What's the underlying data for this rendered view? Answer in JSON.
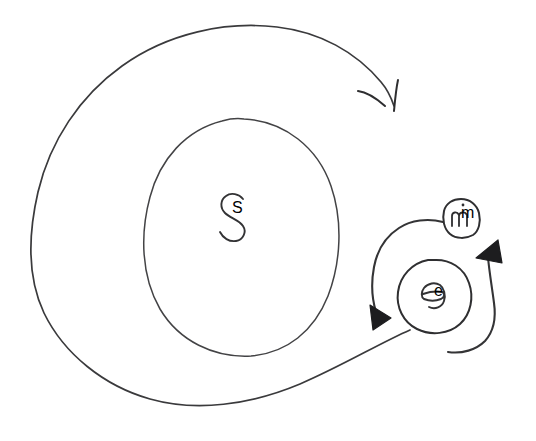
{
  "diagram": {
    "title": "Hand-drawn spiral diagram with labelled regions S, e and m",
    "style": "hand-drawn-pen-sketch",
    "background_color": "#ffffff",
    "ink_color": "#3a3a3c",
    "arrowhead_color": "#1d1d1f",
    "canvas": {
      "width": 536,
      "height": 441
    },
    "labels": [
      {
        "id": "label-s",
        "text": "S",
        "glyph": "s-letter",
        "x": 232,
        "y": 213,
        "container": "inner-oval",
        "description": "Letter S inside the large inner oval"
      },
      {
        "id": "label-e",
        "text": "e",
        "glyph": "e-letter",
        "x": 434,
        "y": 296,
        "container": "e-circle",
        "description": "Letter e inside the small circle at right"
      },
      {
        "id": "label-m",
        "text": "m",
        "glyph": "m-letter",
        "x": 461,
        "y": 218,
        "container": "m-blob",
        "description": "Letter m inside the tiny blob above the e circle"
      }
    ],
    "shapes": [
      {
        "id": "outer-spiral",
        "kind": "spiral-arrow",
        "label": "outer spiral sweep",
        "direction": "clockwise",
        "arrowhead": "open-v",
        "arrowhead_x": 394,
        "arrowhead_y": 110
      },
      {
        "id": "inner-oval",
        "kind": "closed-oval",
        "label": "inner oval S region",
        "center_x": 240,
        "center_y": 237,
        "radius_x": 95,
        "radius_y": 119
      },
      {
        "id": "e-circle",
        "kind": "closed-circle",
        "label": "small circle e region",
        "center_x": 433,
        "center_y": 295,
        "radius_x": 36,
        "radius_y": 35
      },
      {
        "id": "m-blob",
        "kind": "closed-blob",
        "label": "tiny blob m region",
        "center_x": 461,
        "center_y": 217,
        "radius_x": 17,
        "radius_y": 19
      },
      {
        "id": "left-arc-arrow",
        "kind": "arc-arrow",
        "label": "left arc around e, counterclockwise",
        "direction": "counterclockwise",
        "arrowhead": "filled-triangle",
        "arrowhead_x": 379,
        "arrowhead_y": 321,
        "start_x": 443,
        "start_y": 222
      },
      {
        "id": "right-arc-arrow",
        "kind": "arc-arrow",
        "label": "right arc around e, counterclockwise",
        "direction": "counterclockwise",
        "arrowhead": "filled-triangle",
        "arrowhead_x": 489,
        "arrowhead_y": 250,
        "start_x": 448,
        "start_y": 352
      }
    ]
  }
}
